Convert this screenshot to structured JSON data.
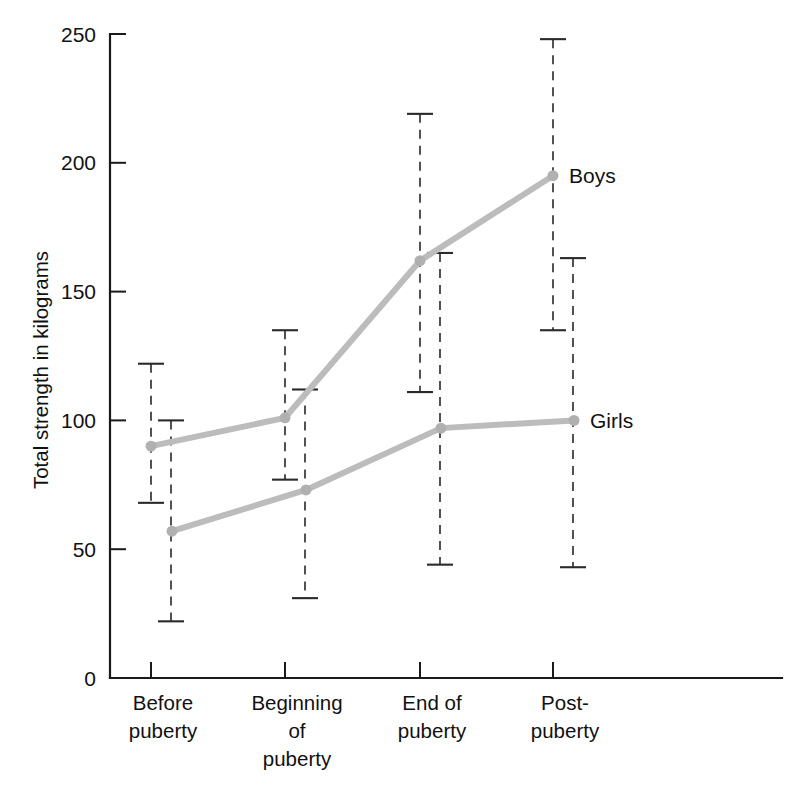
{
  "chart_data": {
    "type": "line",
    "title": "",
    "xlabel": "",
    "ylabel": "Total strength in kilograms",
    "categories": [
      "Before puberty",
      "Beginning of puberty",
      "End of puberty",
      "Post-puberty"
    ],
    "category_lines": [
      [
        "Before",
        "puberty"
      ],
      [
        "Beginning",
        "of",
        "puberty"
      ],
      [
        "End of",
        "puberty"
      ],
      [
        "Post-",
        "puberty"
      ]
    ],
    "ylim": [
      0,
      250
    ],
    "yticks": [
      0,
      50,
      100,
      150,
      200,
      250
    ],
    "ytick_labels": [
      "0",
      "50",
      "100",
      "150",
      "200",
      "250"
    ],
    "grid": false,
    "legend_position": "inline-right-of-last-point",
    "error_bars": true,
    "series": [
      {
        "name": "Boys",
        "label": "Boys",
        "color": "#bcbcbc",
        "values": [
          90,
          101,
          162,
          195
        ],
        "err_upper": [
          122,
          135,
          219,
          248
        ],
        "err_lower": [
          68,
          77,
          111,
          135
        ]
      },
      {
        "name": "Girls",
        "label": "Girls",
        "color": "#bcbcbc",
        "values": [
          57,
          73,
          97,
          100
        ],
        "err_upper": [
          100,
          112,
          165,
          163
        ],
        "err_lower": [
          22,
          31,
          44,
          43
        ]
      }
    ]
  },
  "axes": {
    "y_label": "Total strength in kilograms"
  }
}
